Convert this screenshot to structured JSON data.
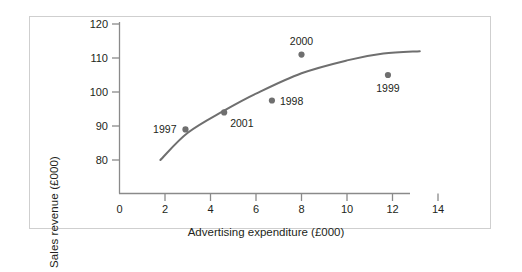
{
  "chart_data": {
    "type": "scatter",
    "title": "",
    "xlabel": "Advertising expenditure (£000)",
    "ylabel": "Sales revenue (£000)",
    "xlim": [
      0,
      14.8
    ],
    "ylim": [
      74,
      120
    ],
    "xticks": [
      "0",
      "2",
      "4",
      "6",
      "8",
      "10",
      "12",
      "14"
    ],
    "xtick_values": [
      0,
      2,
      4,
      6,
      8,
      10,
      12,
      14
    ],
    "yticks": [
      "80",
      "90",
      "100",
      "110",
      "120"
    ],
    "ytick_values": [
      80,
      90,
      100,
      110,
      120
    ],
    "grid": false,
    "legend": "none",
    "point_color": "#6f6f6f",
    "curve_color": "#6f6f6f",
    "axis_color": "#8a8a8a",
    "text_color": "#231f20",
    "points": [
      {
        "label": "1997",
        "x": 2.9,
        "y": 89.0,
        "label_pos": "left"
      },
      {
        "label": "2001",
        "x": 4.6,
        "y": 94.0,
        "label_pos": "right-below"
      },
      {
        "label": "1998",
        "x": 6.7,
        "y": 97.5,
        "label_pos": "right"
      },
      {
        "label": "2000",
        "x": 8.0,
        "y": 111.0,
        "label_pos": "above"
      },
      {
        "label": "1999",
        "x": 11.8,
        "y": 105.0,
        "label_pos": "below"
      }
    ],
    "trend_curve": {
      "description": "fitted logarithmic trend line",
      "x_start": 1.8,
      "x_end": 13.2,
      "y_start": 80.0,
      "y_end": 112.0,
      "points": [
        [
          1.8,
          80.0
        ],
        [
          3.0,
          88.0
        ],
        [
          4.6,
          94.5
        ],
        [
          6.0,
          99.5
        ],
        [
          8.0,
          105.5
        ],
        [
          10.0,
          109.3
        ],
        [
          11.6,
          111.3
        ],
        [
          13.2,
          112.0
        ]
      ]
    }
  }
}
